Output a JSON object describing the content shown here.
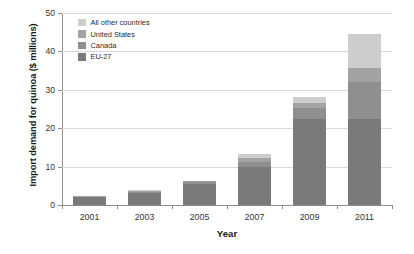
{
  "chart_data": {
    "type": "bar",
    "title": "",
    "subtitle": "",
    "xlabel": "Year",
    "ylabel": "Import demand for quinoa ($ millions)",
    "categories": [
      "2001",
      "2003",
      "2005",
      "2007",
      "2009",
      "2011"
    ],
    "ylim": [
      0,
      50
    ],
    "yticks": [
      0,
      10,
      20,
      30,
      40,
      50
    ],
    "ytick_labels": [
      "0",
      "10",
      "20",
      "30",
      "40",
      "50"
    ],
    "grid": true,
    "stacked": true,
    "legend_position": "upper-left-inside",
    "series": [
      {
        "name": "EU-27",
        "color": "#7a7a7a",
        "values": [
          2.0,
          3.0,
          5.6,
          9.8,
          22.3,
          22.4
        ]
      },
      {
        "name": "Canada",
        "color": "#8f8f8f",
        "values": [
          0.2,
          0.5,
          0.4,
          1.4,
          2.9,
          9.6
        ]
      },
      {
        "name": "United States",
        "color": "#a3a3a3",
        "values": [
          0.1,
          0.2,
          0.2,
          1.0,
          1.4,
          3.8
        ]
      },
      {
        "name": "All other countries",
        "color": "#cdcdcd",
        "values": [
          0.05,
          0.1,
          0.1,
          1.0,
          1.6,
          8.7
        ]
      }
    ],
    "totals": [
      2.35,
      3.8,
      6.3,
      13.2,
      28.2,
      44.5
    ]
  },
  "legend": {
    "items": [
      {
        "label": "All other countries",
        "color": "#cdcdcd"
      },
      {
        "label": "United States",
        "color": "#a3a3a3"
      },
      {
        "label": "Canada",
        "color": "#8f8f8f"
      },
      {
        "label": "EU-27",
        "color": "#7a7a7a"
      }
    ]
  },
  "axes": {
    "y_title": "Import demand for quinoa ($ millions)",
    "x_title": "Year"
  },
  "colors": {
    "grid": "#d9d9d9",
    "axis": "#8d8d8d",
    "text": "#333333",
    "background": "#ffffff"
  }
}
